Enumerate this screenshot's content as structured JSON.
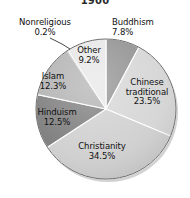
{
  "chart_data": {
    "type": "pie",
    "title": "1900",
    "xlabel": "",
    "ylabel": "",
    "legend": "none",
    "grid": false,
    "units": "percent",
    "start_angle_deg": 0,
    "direction": "clockwise",
    "categories": [
      "Buddhism",
      "Chinese traditional",
      "Christianity",
      "Hinduism",
      "Islam",
      "Nonreligious",
      "Other"
    ],
    "values": [
      7.8,
      23.5,
      34.5,
      12.5,
      12.3,
      0.2,
      9.2
    ],
    "slices": [
      {
        "label": "Buddhism",
        "value": 7.8,
        "value_text": "7.8%",
        "color": "#8f8f8f",
        "label_position": "outside-right"
      },
      {
        "label": "Chinese traditional",
        "value": 23.5,
        "value_text": "23.5%",
        "color": "#d5d5d5",
        "label_position": "inside"
      },
      {
        "label": "Christianity",
        "value": 34.5,
        "value_text": "34.5%",
        "color": "#cfcfcf",
        "label_position": "inside"
      },
      {
        "label": "Hinduism",
        "value": 12.5,
        "value_text": "12.5%",
        "color": "#7b7b7b",
        "label_position": "inside"
      },
      {
        "label": "Islam",
        "value": 12.3,
        "value_text": "12.3%",
        "color": "#b0b0b0",
        "label_position": "inside"
      },
      {
        "label": "Nonreligious",
        "value": 0.2,
        "value_text": "0.2%",
        "color": "#bdbdbd",
        "label_position": "outside-left-with-leader"
      },
      {
        "label": "Other",
        "value": 9.2,
        "value_text": "9.2%",
        "color": "#e6e6e6",
        "label_position": "inside"
      }
    ]
  },
  "labels": {
    "nonreligious": {
      "name": "Nonreligious",
      "value": "0.2%"
    },
    "buddhism": {
      "name": "Buddhism",
      "value": "7.8%"
    },
    "other": {
      "name": "Other",
      "value": "9.2%"
    },
    "chinese_line1": "Chinese",
    "chinese_line2": "traditional",
    "chinese_value": "23.5%",
    "islam": {
      "name": "Islam",
      "value": "12.3%"
    },
    "hinduism": {
      "name": "Hinduism",
      "value": "12.5%"
    },
    "christianity": {
      "name": "Christianity",
      "value": "34.5%"
    }
  },
  "colors": {
    "background": "#ffffff",
    "text": "#111111",
    "outline": "#6b6b6b"
  }
}
